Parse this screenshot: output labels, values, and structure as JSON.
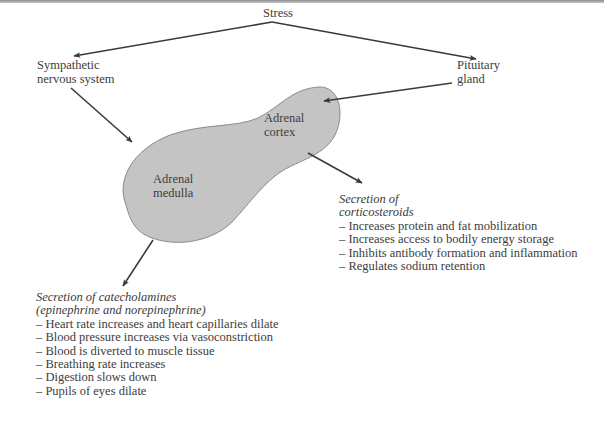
{
  "diagram": {
    "title_node": "Stress",
    "nodes": {
      "sympathetic": [
        "Sympathetic",
        "nervous system"
      ],
      "pituitary": [
        "Pituitary",
        "gland"
      ],
      "adrenal_cortex": [
        "Adrenal",
        "cortex"
      ],
      "adrenal_medulla": [
        "Adrenal",
        "medulla"
      ]
    },
    "corticosteroids": {
      "heading": [
        "Secretion of",
        "corticosteroids"
      ],
      "effects": [
        "– Increases protein and fat mobilization",
        "– Increases access to bodily energy storage",
        "– Inhibits antibody formation and inflammation",
        "– Regulates sodium retention"
      ]
    },
    "catecholamines": {
      "heading": [
        "Secretion of catecholamines",
        "(epinephrine and norepinephrine)"
      ],
      "effects": [
        "– Heart rate increases and heart capillaries dilate",
        "– Blood pressure increases via vasoconstriction",
        "– Blood is diverted to muscle tissue",
        "– Breathing rate increases",
        "– Digestion slows down",
        "– Pupils of eyes dilate"
      ]
    },
    "colors": {
      "gland_fill": "#c4c4c4",
      "gland_stroke": "#8a8a8a",
      "arrow": "#3a3a3a",
      "text": "#3c3c3c"
    }
  }
}
